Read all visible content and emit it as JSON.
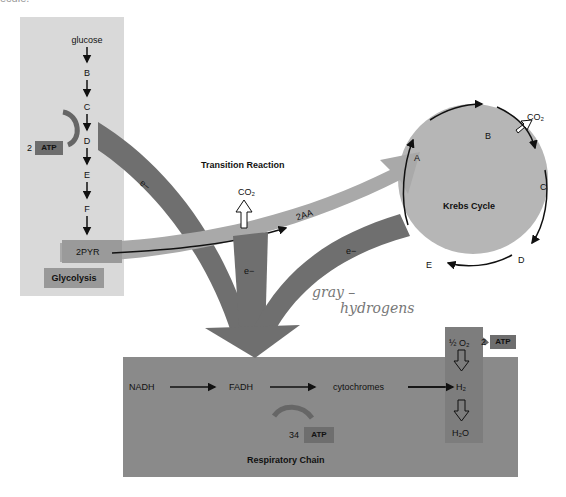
{
  "top_fragment": "ecule.",
  "glycolysis": {
    "steps": [
      "glucose",
      "B",
      "C",
      "D",
      "E",
      "F"
    ],
    "product": "2PYR",
    "label": "Glycolysis",
    "atp": {
      "count": "2",
      "label": "ATP"
    }
  },
  "transition": {
    "title": "Transition Reaction",
    "co2": "CO₂",
    "product": "2AA"
  },
  "electron_labels": [
    "e−",
    "e−",
    "e−"
  ],
  "krebs": {
    "title": "Krebs Cycle",
    "nodes": [
      "A",
      "B",
      "C",
      "D",
      "E"
    ],
    "co2": "CO₂",
    "atp": {
      "count": "2",
      "label": "ATP"
    }
  },
  "respiratory_chain": {
    "title": "Respiratory Chain",
    "carriers": [
      "NADH",
      "FADH",
      "cytochromes"
    ],
    "oxygen": "½ O₂",
    "hydrogen": "H₂",
    "water": "H₂O",
    "atp": {
      "count": "34",
      "label": "ATP"
    }
  },
  "handwritten_note": {
    "line1": "gray –",
    "line2": "hydrogens"
  },
  "colors": {
    "glycolysis_panel": "#d9d9d9",
    "electron_arrow": "#6f6f6f",
    "transition_arrow": "#a9a9a9",
    "krebs_fill": "#b6b6b6",
    "respiratory_fill": "#8a8a8a",
    "atp_box": "#6e6e6e"
  }
}
